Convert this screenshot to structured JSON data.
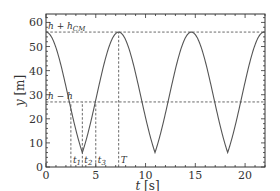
{
  "chart_data": {
    "type": "line",
    "title": "",
    "xlabel": "t [s]",
    "ylabel": "y [m]",
    "xlim": [
      0,
      22
    ],
    "ylim": [
      0,
      63.5
    ],
    "grid": false,
    "legend": null,
    "xticks": [
      0,
      5,
      10,
      15,
      20
    ],
    "yticks": [
      0,
      10,
      20,
      30,
      40,
      50,
      60
    ],
    "xtick_labels": [
      "0",
      "5",
      "10",
      "15",
      "20"
    ],
    "ytick_labels": [
      "0",
      "10",
      "20",
      "30",
      "40",
      "50",
      "60"
    ],
    "series": [
      {
        "name": "y(t)",
        "period": 7.3,
        "max": 56,
        "min": 6,
        "x": [
          0,
          1,
          2,
          2.5,
          3,
          3.65,
          4.3,
          5,
          6,
          7.3,
          8.3,
          9.3,
          10,
          10.95,
          11.9,
          12.5,
          13.6,
          14.6,
          15.6,
          16.6,
          17.3,
          18.25,
          19.2,
          19.9,
          20.9,
          21.9
        ],
        "y": [
          56,
          51,
          37,
          27,
          18,
          6,
          18,
          27,
          43,
          56,
          51,
          37,
          20,
          6,
          20,
          28,
          47,
          56,
          51,
          37,
          20,
          6,
          20,
          28,
          47,
          56
        ]
      }
    ],
    "hlines": [
      {
        "y": 56,
        "label": "h + h_CM",
        "style": "dashed"
      },
      {
        "y": 27,
        "label": "h − h",
        "style": "dashed"
      }
    ],
    "vlines": [
      {
        "x": 2.5,
        "label": "t1",
        "style": "dashed"
      },
      {
        "x": 3.65,
        "label": "t2",
        "style": "dashed"
      },
      {
        "x": 5.0,
        "label": "t3",
        "style": "dashed"
      },
      {
        "x": 7.3,
        "label": "T",
        "style": "dashed"
      }
    ]
  },
  "labels": {
    "xlabel_var": "t",
    "xlabel_unit": "[s]",
    "ylabel_var": "y",
    "ylabel_unit": "[m]",
    "h_top": "h + h",
    "h_top_sub": "CM",
    "h_low": "h − h",
    "t1": "t",
    "t1_sub": "1",
    "t2": "t",
    "t2_sub": "2",
    "t3": "t",
    "t3_sub": "3",
    "T": "T"
  },
  "colors": {
    "curve": "#555555",
    "axis": "#333333",
    "dash": "#444444"
  }
}
